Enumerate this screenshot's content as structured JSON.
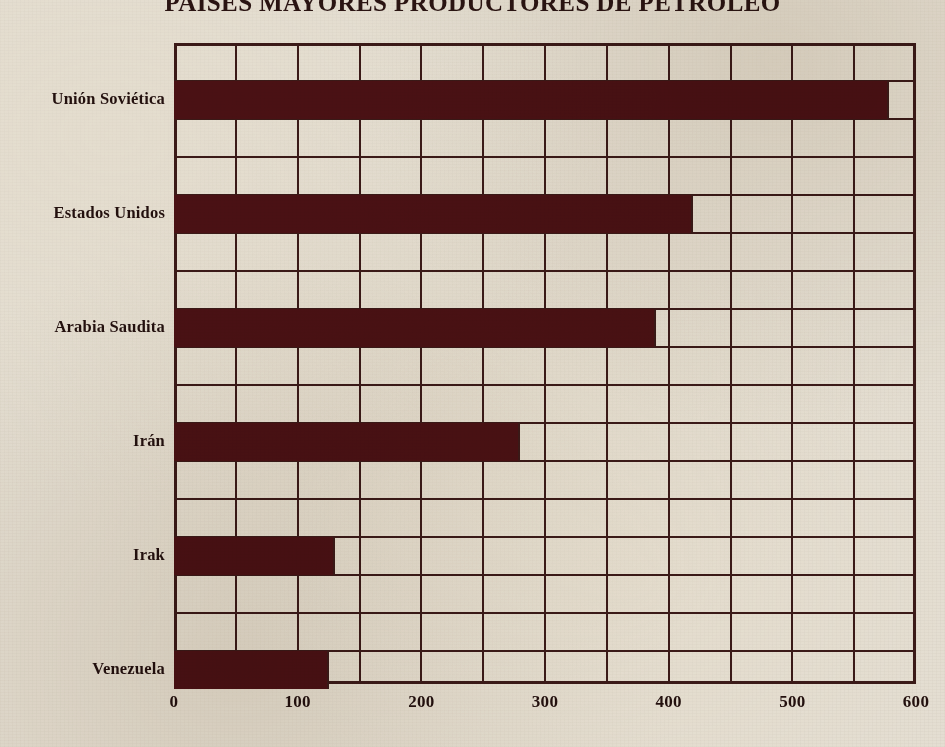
{
  "chart_data": {
    "type": "bar",
    "orientation": "horizontal",
    "title": "PAÍSES MAYORES PRODUCTORES DE PETRÓLEO",
    "xlabel": "",
    "ylabel": "",
    "categories": [
      "Unión Soviética",
      "Estados Unidos",
      "Arabia Saudita",
      "Irán",
      "Irak",
      "Venezuela"
    ],
    "values": [
      578,
      420,
      390,
      280,
      130,
      125
    ],
    "xlim": [
      0,
      600
    ],
    "xticks": [
      0,
      100,
      200,
      300,
      400,
      500,
      600
    ],
    "xtick_labels": [
      "0",
      "100",
      "200",
      "300",
      "400",
      "500",
      "600"
    ],
    "minor_gridline_step": 50,
    "grid": true,
    "legend": false,
    "bar_color": "#4a1114",
    "grid_color": "#3b1a18",
    "background_color": "#e4ded2",
    "text_color": "#23100e"
  }
}
